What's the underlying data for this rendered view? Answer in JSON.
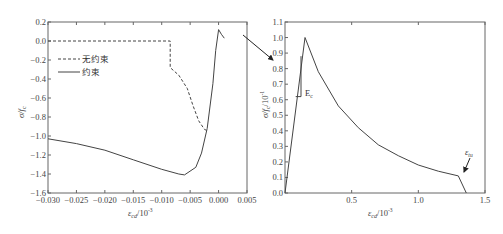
{
  "chart_data": [
    {
      "type": "line",
      "panel": "left",
      "title": "",
      "xlabel": "ε_cd/10⁻³",
      "ylabel": "σ/f_c",
      "xlim": [
        -0.03,
        0.005
      ],
      "ylim": [
        -1.6,
        0.2
      ],
      "x_ticks": [
        "-0.030",
        "-0.025",
        "-0.020",
        "-0.015",
        "-0.010",
        "-0.005",
        "0.000",
        "0.005"
      ],
      "y_ticks": [
        "0.2",
        "0.0",
        "-0.2",
        "-0.4",
        "-0.6",
        "-0.8",
        "-1.0",
        "-1.2",
        "-1.4",
        "-1.6"
      ],
      "grid": false,
      "legend": {
        "position": "upper-left",
        "entries": [
          "无约束",
          "约束"
        ]
      },
      "series": [
        {
          "name": "无约束",
          "style": "dashed",
          "x": [
            -0.03,
            -0.0085,
            -0.0085,
            -0.007,
            -0.0055,
            -0.0045,
            -0.0035,
            -0.0025,
            -0.0018
          ],
          "y": [
            0.0,
            0.0,
            -0.28,
            -0.36,
            -0.5,
            -0.68,
            -0.84,
            -0.93,
            -0.95
          ]
        },
        {
          "name": "约束",
          "style": "solid",
          "x": [
            -0.03,
            -0.025,
            -0.02,
            -0.015,
            -0.01,
            -0.007,
            -0.006,
            -0.004,
            -0.003,
            -0.002,
            -0.001,
            -0.0005,
            0.0,
            0.0005,
            0.001
          ],
          "y": [
            -1.03,
            -1.08,
            -1.15,
            -1.25,
            -1.35,
            -1.4,
            -1.41,
            -1.33,
            -1.18,
            -0.92,
            -0.45,
            -0.1,
            0.12,
            0.07,
            0.03
          ]
        }
      ]
    },
    {
      "type": "line",
      "panel": "right",
      "title": "",
      "xlabel": "ε_cd/10⁻³",
      "ylabel": "σ/f_c/10⁻¹",
      "xlim": [
        0.0,
        1.5
      ],
      "ylim": [
        0.0,
        1.1
      ],
      "x_ticks": [
        "0.5",
        "1.0",
        "1.5"
      ],
      "y_ticks": [
        "0.0",
        "0.1",
        "0.2",
        "0.3",
        "0.4",
        "0.5",
        "0.6",
        "0.7",
        "0.8",
        "0.9",
        "1.0",
        "1.1"
      ],
      "grid": false,
      "annotations": [
        "E_c",
        "ε_tu"
      ],
      "series": [
        {
          "name": "envelope",
          "style": "solid",
          "x": [
            0.0,
            0.15,
            0.25,
            0.4,
            0.55,
            0.7,
            0.85,
            1.0,
            1.15,
            1.3,
            1.36
          ],
          "y": [
            0.0,
            1.0,
            0.78,
            0.56,
            0.42,
            0.31,
            0.24,
            0.18,
            0.14,
            0.11,
            0.0
          ]
        }
      ],
      "modulus_triangle": {
        "x": [
          0.08,
          0.12,
          0.12
        ],
        "y": [
          0.62,
          0.62,
          0.88
        ]
      },
      "connector_arrow": {
        "from": "left panel peak",
        "to": "right panel"
      }
    }
  ],
  "left_panel": {
    "ylabel": "σ/f",
    "ylabel_sub": "c",
    "xlabel": "ε",
    "xlabel_sub": "cd",
    "xlabel_suffix": "/10",
    "xlabel_exp": "-3",
    "legend": {
      "dashed": "无约束",
      "solid": "约束"
    }
  },
  "right_panel": {
    "ylabel": "σ/f",
    "ylabel_sub": "c",
    "ylabel_suffix": "/10",
    "ylabel_exp": "-1",
    "xlabel": "ε",
    "xlabel_sub": "cd",
    "xlabel_suffix": "/10",
    "xlabel_exp": "-3",
    "annot_ec": "E",
    "annot_ec_sub": "c",
    "annot_etu": "ε",
    "annot_etu_sub": "tu"
  }
}
